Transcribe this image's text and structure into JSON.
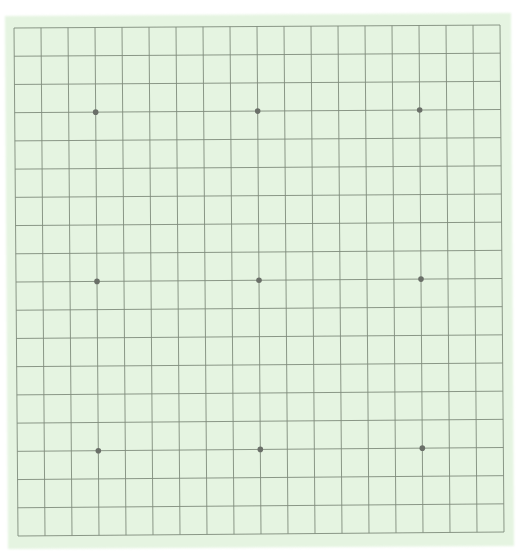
{
  "game": "Go",
  "board": {
    "size": 19,
    "colors": {
      "page_background": "#ffffff",
      "board_fill": "#e5f4e1",
      "board_fill_inner": "#e8f6e4",
      "grid_line": "#7f8b7c",
      "star_point": "#6a6f68"
    },
    "outline_corners": {
      "top_left": [
        5,
        16
      ],
      "top_right": [
        511,
        13
      ],
      "bottom_right": [
        514,
        546
      ],
      "bottom_left": [
        8,
        549
      ]
    },
    "grid_corners": {
      "top_left": [
        14,
        28
      ],
      "top_right": [
        500,
        25
      ],
      "bottom_right": [
        504,
        532
      ],
      "bottom_left": [
        18,
        536
      ]
    },
    "star_points": [
      {
        "col": 3,
        "row": 3
      },
      {
        "col": 9,
        "row": 3
      },
      {
        "col": 15,
        "row": 3
      },
      {
        "col": 3,
        "row": 9
      },
      {
        "col": 9,
        "row": 9
      },
      {
        "col": 15,
        "row": 9
      },
      {
        "col": 3,
        "row": 15
      },
      {
        "col": 9,
        "row": 15
      },
      {
        "col": 15,
        "row": 15
      }
    ],
    "star_radius": 2.8,
    "stones": []
  }
}
